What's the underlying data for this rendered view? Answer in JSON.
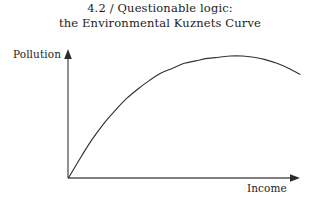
{
  "figure": {
    "title": {
      "line1": "4.2 / Questionable logic:",
      "line2": "the Environmental Kuznets Curve"
    },
    "background_color": "#ffffff",
    "ink_color": "#333333"
  },
  "chart_data": {
    "type": "line",
    "title": "4.2 / Questionable logic: the Environmental Kuznets Curve",
    "xlabel": "Income",
    "ylabel": "Pollution",
    "xlim": [
      0,
      100
    ],
    "ylim": [
      0,
      100
    ],
    "grid": false,
    "legend": null,
    "axis_style": "arrowed-open",
    "tick_labels": {
      "x": [],
      "y": []
    },
    "annotations": [],
    "series": [
      {
        "name": "Environmental Kuznets Curve",
        "color": "#333333",
        "x": [
          0,
          5,
          10,
          15,
          20,
          25,
          30,
          35,
          40,
          45,
          50,
          55,
          60,
          65,
          70,
          75,
          80,
          85,
          90,
          95,
          100
        ],
        "y": [
          0,
          16,
          31,
          44,
          55,
          65,
          73,
          80,
          86,
          90,
          94,
          96,
          98,
          99,
          100,
          100,
          99,
          97,
          94,
          90,
          85
        ]
      }
    ]
  },
  "axes": {
    "y_label": "Pollution",
    "x_label": "Income"
  }
}
